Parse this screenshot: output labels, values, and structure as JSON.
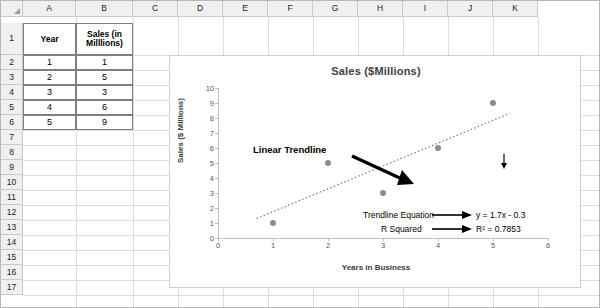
{
  "spreadsheet": {
    "columns": [
      "A",
      "B",
      "C",
      "D",
      "E",
      "F",
      "G",
      "H",
      "I",
      "J",
      "K"
    ],
    "rows": [
      "1",
      "2",
      "3",
      "4",
      "5",
      "6",
      "7",
      "8",
      "9",
      "10",
      "11",
      "12",
      "13",
      "14",
      "15",
      "16",
      "17"
    ],
    "cells": {
      "a1": "Year",
      "b1": "Sales (in Milllions)",
      "a2": "1",
      "b2": "1",
      "a3": "2",
      "b3": "5",
      "a4": "3",
      "b4": "3",
      "a5": "4",
      "b5": "6",
      "a6": "5",
      "b6": "9"
    }
  },
  "chart_data": {
    "type": "scatter",
    "title": "Sales ($Millions)",
    "xlabel": "Years in Business",
    "ylabel": "Sales ($ Millions)",
    "x": [
      1,
      2,
      3,
      4,
      5
    ],
    "y": [
      1,
      5,
      3,
      6,
      9
    ],
    "xlim": [
      0,
      6
    ],
    "ylim": [
      0,
      10
    ],
    "xticks": [
      "0",
      "1",
      "2",
      "3",
      "4",
      "5",
      "6"
    ],
    "yticks": [
      "0",
      "1",
      "2",
      "3",
      "4",
      "5",
      "6",
      "7",
      "8",
      "9",
      "10"
    ],
    "grid": false,
    "legend": "none",
    "trendline": {
      "type": "linear",
      "slope": 1.7,
      "intercept": -0.3,
      "r_squared": 0.7853,
      "style": "dotted"
    },
    "annotations": {
      "trendline_label": "Linear Trendline",
      "equation_label": "Trendline Equation",
      "equation_value": "y = 1.7x - 0.3",
      "rsquared_label": "R Squared",
      "rsquared_value": "R² = 0.7853"
    }
  }
}
